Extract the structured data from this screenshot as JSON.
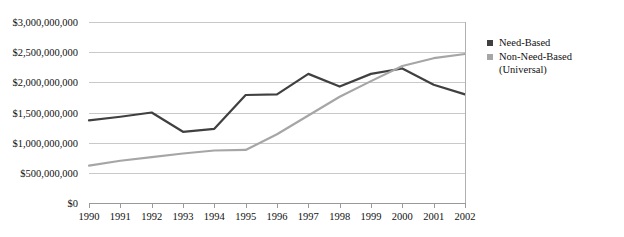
{
  "chart_data": {
    "type": "line",
    "title": "",
    "xlabel": "",
    "ylabel": "",
    "x": [
      1990,
      1991,
      1992,
      1993,
      1994,
      1995,
      1996,
      1997,
      1998,
      1999,
      2000,
      2001
    ],
    "categories": [
      "1990",
      "1991",
      "1992",
      "1993",
      "1994",
      "1995",
      "1996",
      "1997",
      "1998",
      "1999",
      "2000",
      "2001",
      "2002"
    ],
    "xlim": [
      1990,
      2002
    ],
    "ylim": [
      0,
      3000000000
    ],
    "ytick_values": [
      3000000000,
      2500000000,
      2000000000,
      1500000000,
      1000000000,
      500000000,
      0
    ],
    "ytick_labels": [
      "$3,000,000,000",
      "$2,500,000,000",
      "$2,000,000,000",
      "$1,500,000,000",
      "$1,000,000,000",
      "$500,000,000",
      "$0"
    ],
    "grid": true,
    "legend_position": "right",
    "series": [
      {
        "name": "Need-Based",
        "color": "#404040",
        "values": [
          1370000000,
          1430000000,
          1500000000,
          1180000000,
          1230000000,
          1790000000,
          1800000000,
          2140000000,
          1930000000,
          2140000000,
          2230000000,
          1960000000,
          1800000000
        ]
      },
      {
        "name": "Non-Need-Based (Universal)",
        "color": "#a6a6a6",
        "values": [
          620000000,
          700000000,
          760000000,
          820000000,
          870000000,
          880000000,
          1140000000,
          1450000000,
          1760000000,
          2020000000,
          2270000000,
          2400000000,
          2470000000
        ]
      }
    ]
  },
  "legend": {
    "entries": [
      {
        "label": "Need-Based",
        "color": "#404040"
      },
      {
        "label": "Non-Need-Based\n   (Universal)",
        "color": "#a6a6a6"
      }
    ]
  }
}
